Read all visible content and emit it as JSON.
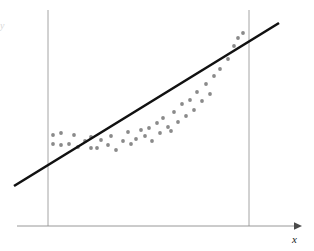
{
  "figure": {
    "title": "",
    "background_color": "#ffffff",
    "width": 314,
    "height": 251
  },
  "axes": {
    "x_axis": {
      "label": "x",
      "color": "#8c8c8c",
      "y_pixel": 226,
      "x_start": 17,
      "x_end": 295,
      "arrowhead": true
    },
    "y_axis": {
      "label": "y",
      "color": "#d8d8d8",
      "visible": false
    },
    "reference_lines": [
      {
        "name": "left-boundary",
        "x_pixel": 48,
        "y_top": 10,
        "y_bottom": 226,
        "color": "#9a9a9a"
      },
      {
        "name": "right-boundary",
        "x_pixel": 249,
        "y_top": 10,
        "y_bottom": 226,
        "color": "#9a9a9a"
      }
    ]
  },
  "chart_data": {
    "type": "scatter",
    "title": "",
    "subtitle": "",
    "xlabel": "x",
    "ylabel": "",
    "grid": false,
    "legend": null,
    "xlim": [
      0,
      314
    ],
    "ylim": [
      251,
      0
    ],
    "axis_note": "values given in pixel coordinates of the figure; y increases downward",
    "marker": {
      "shape": "circle",
      "color": "#8a8a8a",
      "radius": 1.9,
      "count": 44
    },
    "points": [
      [
        53,
        135
      ],
      [
        53,
        144
      ],
      [
        61,
        133
      ],
      [
        61,
        145
      ],
      [
        69,
        144
      ],
      [
        74,
        135
      ],
      [
        78,
        147
      ],
      [
        85,
        141
      ],
      [
        91,
        137
      ],
      [
        91,
        148
      ],
      [
        97,
        148
      ],
      [
        101,
        140
      ],
      [
        108,
        145
      ],
      [
        111,
        136
      ],
      [
        116,
        150
      ],
      [
        123,
        141
      ],
      [
        128,
        132
      ],
      [
        131,
        144
      ],
      [
        136,
        139
      ],
      [
        141,
        130
      ],
      [
        145,
        136
      ],
      [
        149,
        128
      ],
      [
        152,
        141
      ],
      [
        157,
        123
      ],
      [
        160,
        133
      ],
      [
        163,
        118
      ],
      [
        168,
        127
      ],
      [
        171,
        131
      ],
      [
        174,
        112
      ],
      [
        178,
        122
      ],
      [
        182,
        104
      ],
      [
        186,
        116
      ],
      [
        190,
        100
      ],
      [
        194,
        110
      ],
      [
        197,
        92
      ],
      [
        202,
        101
      ],
      [
        206,
        84
      ],
      [
        210,
        94
      ],
      [
        214,
        76
      ],
      [
        220,
        69
      ],
      [
        228,
        59
      ],
      [
        234,
        46
      ],
      [
        238,
        38
      ],
      [
        243,
        33
      ]
    ],
    "fit_line": {
      "name": "least-squares-line",
      "type": "line",
      "color": "#111111",
      "width": 2.6,
      "x1": 14,
      "y1": 186,
      "x2": 279,
      "y2": 23,
      "slope_note": "positive slope, straight line fitted through curved data"
    }
  }
}
